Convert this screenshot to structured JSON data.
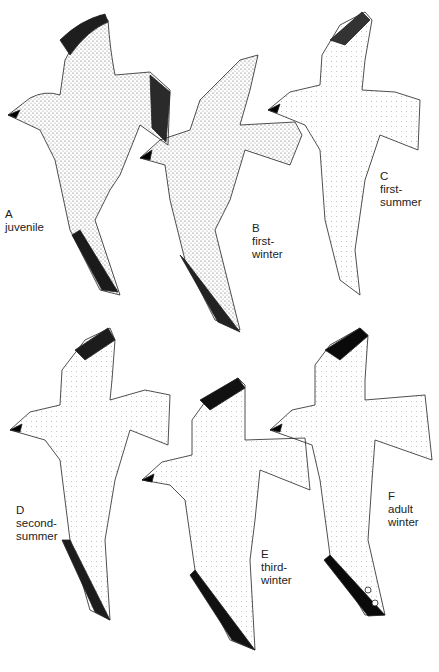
{
  "plate": {
    "figures": [
      {
        "letter": "A",
        "lines": [
          "juvenile"
        ],
        "shade": "#9a9a9a",
        "tip": "#1e1e1e"
      },
      {
        "letter": "B",
        "lines": [
          "first-",
          "winter"
        ],
        "shade": "#a6a6a6",
        "tip": "#262626"
      },
      {
        "letter": "C",
        "lines": [
          "first-",
          "summer"
        ],
        "shade": "#c4c4c4",
        "tip": "#3a3a3a"
      },
      {
        "letter": "D",
        "lines": [
          "second-",
          "summer"
        ],
        "shade": "#cfcfcf",
        "tip": "#1c1c1c"
      },
      {
        "letter": "E",
        "lines": [
          "third-",
          "winter"
        ],
        "shade": "#e4e4e4",
        "tip": "#111111"
      },
      {
        "letter": "F",
        "lines": [
          "adult",
          "winter"
        ],
        "shade": "#dcdcdc",
        "tip": "#0a0a0a"
      }
    ]
  }
}
